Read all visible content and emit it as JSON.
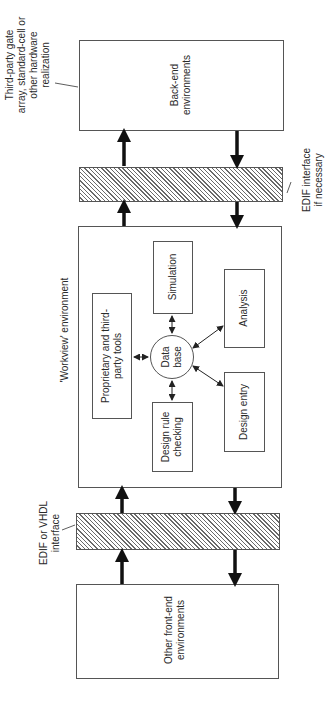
{
  "diagram": {
    "orientation": "rotated-90-ccw",
    "nodes": {
      "back_end": {
        "line1": "Back-end",
        "line2": "environments"
      },
      "edif_upper": {
        "label_line1": "EDIF interface",
        "label_line2": "if necessary"
      },
      "workview": {
        "label": "'Workview' environment",
        "proprietary": {
          "line1": "Proprietary and third-",
          "line2": "party tools"
        },
        "simulation": {
          "line1": "Simulation"
        },
        "database": {
          "line1": "Data",
          "line2": "base"
        },
        "analysis": {
          "line1": "Analysis"
        },
        "design_entry": {
          "line1": "Design entry"
        },
        "design_rule": {
          "line1": "Design rule",
          "line2": "checking"
        }
      },
      "edif_lower": {
        "label_line1": "EDIF or VHDL",
        "label_line2": "interface"
      },
      "front_end": {
        "line1": "Other front-end",
        "line2": "environments"
      }
    },
    "annotations": {
      "hardware": {
        "line1": "Third-party gate",
        "line2": "array, standard-cell or",
        "line3": "other hardware",
        "line4": "realization"
      }
    },
    "edges": [
      {
        "from": "workview",
        "to": "edif_upper",
        "type": "thick-arrow"
      },
      {
        "from": "edif_upper",
        "to": "back_end",
        "type": "thick-arrow"
      },
      {
        "from": "back_end",
        "to": "edif_upper",
        "type": "thick-arrow"
      },
      {
        "from": "edif_upper",
        "to": "workview",
        "type": "thick-arrow"
      },
      {
        "from": "front_end",
        "to": "edif_lower",
        "type": "thick-arrow"
      },
      {
        "from": "edif_lower",
        "to": "workview",
        "type": "thick-arrow"
      },
      {
        "from": "workview",
        "to": "edif_lower",
        "type": "thick-arrow"
      },
      {
        "from": "edif_lower",
        "to": "front_end",
        "type": "thick-arrow"
      },
      {
        "from": "database",
        "to": "simulation",
        "type": "bidirectional"
      },
      {
        "from": "database",
        "to": "proprietary",
        "type": "bidirectional"
      },
      {
        "from": "database",
        "to": "analysis",
        "type": "bidirectional"
      },
      {
        "from": "database",
        "to": "design_entry",
        "type": "bidirectional"
      },
      {
        "from": "database",
        "to": "design_rule",
        "type": "bidirectional"
      }
    ]
  }
}
